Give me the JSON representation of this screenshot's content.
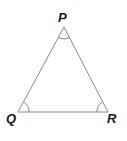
{
  "figure": {
    "type": "geometry-diagram",
    "shape": "triangle",
    "background_color": "#ffffff",
    "stroke_color": "#8a8a8a",
    "label_color": "#1a1a1a",
    "stroke_width": 1,
    "vertices": [
      {
        "id": "P",
        "label": "P",
        "x": 64,
        "y": 27,
        "label_x": 58,
        "label_y": 11
      },
      {
        "id": "Q",
        "label": "Q",
        "x": 18,
        "y": 112,
        "label_x": 6,
        "label_y": 112
      },
      {
        "id": "R",
        "label": "R",
        "x": 108,
        "y": 112,
        "label_x": 107,
        "label_y": 112
      }
    ],
    "sides": [
      {
        "id": "PQ",
        "from": "P",
        "to": "Q"
      },
      {
        "id": "QR",
        "from": "Q",
        "to": "R"
      },
      {
        "id": "RP",
        "from": "R",
        "to": "P"
      }
    ],
    "angle_marks": [
      {
        "id": "angle-P",
        "at": "P",
        "arcs": 1,
        "radius": 11
      },
      {
        "id": "angle-Q",
        "at": "Q",
        "arcs": 1,
        "radius": 11
      },
      {
        "id": "angle-R",
        "at": "R",
        "arcs": 1,
        "radius": 11
      }
    ],
    "paths": {
      "triangle": "M 64 27 L 18 112 L 108 112 Z",
      "arc_P": "M 58.0 37.0 A 11 11 0 0 0 70.0 37.0",
      "arc_Q": "M 29.0 112 A 11 11 0 0 0 23.9 102.2",
      "arc_R": "M 102.1 102.2 A 11 11 0 0 0 97.0 112"
    }
  }
}
